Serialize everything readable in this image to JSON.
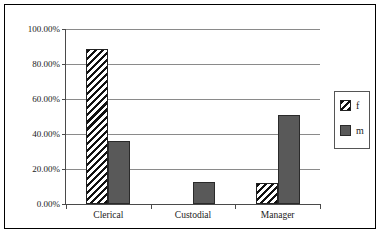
{
  "chart_data": {
    "type": "bar",
    "title": "",
    "subtitle": "",
    "xlabel": "",
    "ylabel": "",
    "categories": [
      "Clerical",
      "Custodial",
      "Manager"
    ],
    "series": [
      {
        "name": "f",
        "values": [
          88.6,
          0.0,
          12.0
        ],
        "pattern": "diagonal-hatch",
        "color": "#ffffff"
      },
      {
        "name": "m",
        "values": [
          36.0,
          12.7,
          51.0
        ],
        "pattern": "solid",
        "color": "#595959"
      }
    ],
    "ylim": [
      0,
      100
    ],
    "y_ticks": [
      0,
      20,
      40,
      60,
      80,
      100
    ],
    "y_tick_labels": [
      "0.00%",
      "20.00%",
      "40.00%",
      "60.00%",
      "80.00%",
      "100.00%"
    ],
    "value_format": "percent",
    "grid": true,
    "grid_axis": "y",
    "legend": {
      "position": "right",
      "entries": [
        "f",
        "m"
      ]
    },
    "border": true
  },
  "legend": {
    "entries": [
      {
        "label": "f",
        "swatch": "hatch-swatch"
      },
      {
        "label": "m",
        "swatch": "solid-swatch"
      }
    ]
  },
  "colors": {
    "series_m": "#595959",
    "series_f": "#ffffff",
    "gridline": "#8a8a8a",
    "axis": "#4a4a4a",
    "frame": "#000000",
    "text": "#1a1a1a"
  }
}
